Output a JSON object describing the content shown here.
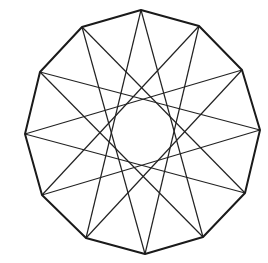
{
  "diagram": {
    "type": "star-polygon",
    "notation": "{12/5}",
    "sides": 12,
    "skip": 5,
    "outline_color": "#1a1a1a",
    "star_color": "#222222",
    "background": "#ffffff",
    "vertices": [
      [
        141,
        10
      ],
      [
        199,
        26
      ],
      [
        242,
        70
      ],
      [
        260,
        130
      ],
      [
        245,
        193
      ],
      [
        203,
        237
      ],
      [
        145,
        254
      ],
      [
        86,
        238
      ],
      [
        42,
        195
      ],
      [
        25,
        134
      ],
      [
        40,
        72
      ],
      [
        82,
        27
      ]
    ]
  }
}
